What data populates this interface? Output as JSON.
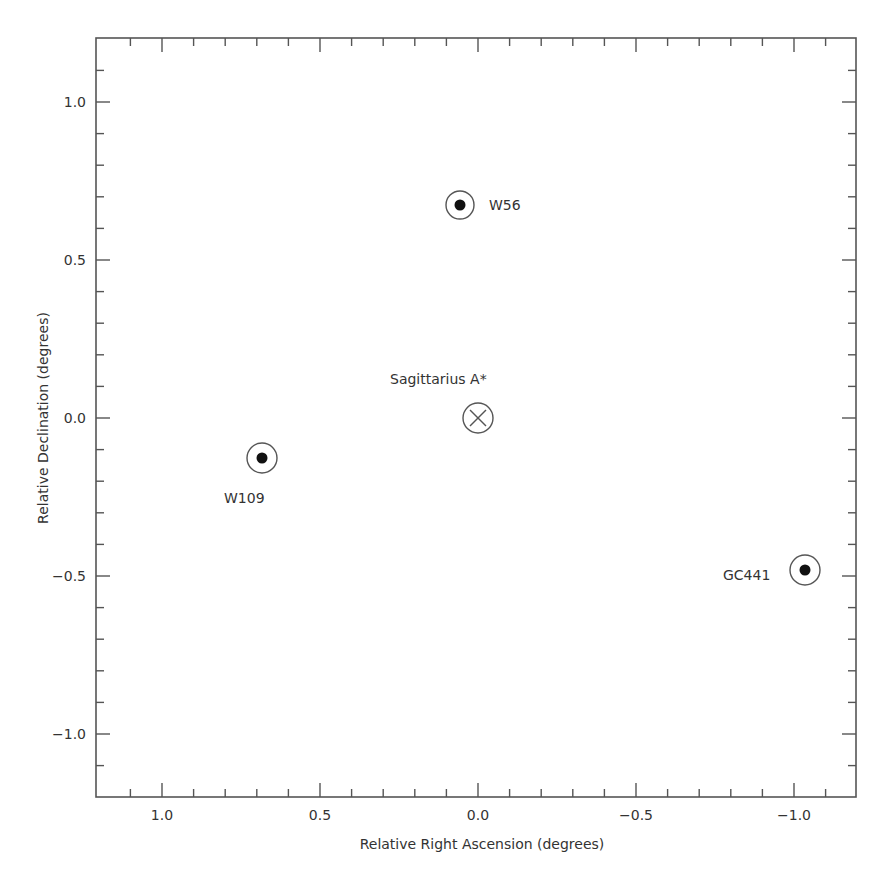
{
  "chart_data": {
    "type": "scatter",
    "title": "",
    "xlabel": "Relative Right Ascension (degrees)",
    "ylabel": "Relative Declination (degrees)",
    "xlim": [
      1.2,
      -1.2
    ],
    "ylim": [
      -1.2,
      1.2
    ],
    "x_inverted": true,
    "grid": false,
    "legend": null,
    "x_ticks": [
      {
        "value": 1.0,
        "label": "1.0"
      },
      {
        "value": 0.5,
        "label": "0.5"
      },
      {
        "value": 0.0,
        "label": "0.0"
      },
      {
        "value": -0.5,
        "label": "−0.5"
      },
      {
        "value": -1.0,
        "label": "−1.0"
      }
    ],
    "y_ticks": [
      {
        "value": 1.0,
        "label": "1.0"
      },
      {
        "value": 0.5,
        "label": "0.5"
      },
      {
        "value": 0.0,
        "label": "0.0"
      },
      {
        "value": -0.5,
        "label": "−0.5"
      },
      {
        "value": -1.0,
        "label": "−1.0"
      }
    ],
    "minor_tick_step": 0.1,
    "points": [
      {
        "name": "W56",
        "ra": 0.06,
        "dec": 0.67,
        "marker": "circle-dot",
        "label_pos": "right"
      },
      {
        "name": "Sagittarius A*",
        "ra": 0.0,
        "dec": 0.0,
        "marker": "circle-cross",
        "label_pos": "above-left"
      },
      {
        "name": "W109",
        "ra": 0.68,
        "dec": -0.13,
        "marker": "circle-dot",
        "label_pos": "below-left"
      },
      {
        "name": "GC441",
        "ra": -1.03,
        "dec": -0.48,
        "marker": "circle-dot",
        "label_pos": "left"
      }
    ]
  },
  "labels": {
    "xlabel": "Relative Right Ascension (degrees)",
    "ylabel": "Relative Declination (degrees)",
    "x_tick_1": "1.0",
    "x_tick_2": "0.5",
    "x_tick_3": "0.0",
    "x_tick_4": "−0.5",
    "x_tick_5": "−1.0",
    "y_tick_1": "1.0",
    "y_tick_2": "0.5",
    "y_tick_3": "0.0",
    "y_tick_4": "−0.5",
    "y_tick_5": "−1.0",
    "src_w56": "W56",
    "src_sgra": "Sagittarius A*",
    "src_w109": "W109",
    "src_gc441": "GC441"
  }
}
